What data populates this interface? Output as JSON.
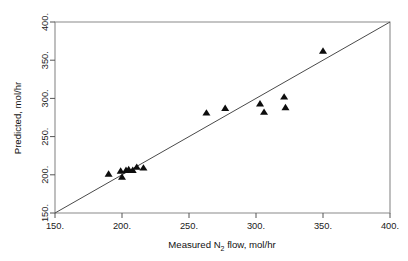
{
  "chart_data": {
    "type": "scatter",
    "title": "",
    "xlabel": "Measured N2 flow, mol/hr",
    "xlabel_parts": {
      "pre": "Measured N",
      "sub": "2",
      "post": " flow, mol/hr"
    },
    "ylabel": "Predicted, mol/hr",
    "xlim": [
      150,
      400
    ],
    "ylim": [
      150,
      400
    ],
    "xticks": [
      150,
      200,
      250,
      300,
      350,
      400
    ],
    "yticks": [
      150,
      200,
      250,
      300,
      350,
      400
    ],
    "xtick_labels": [
      "150.",
      "200.",
      "250.",
      "300.",
      "350.",
      "400."
    ],
    "ytick_labels": [
      "150.",
      "200.",
      "250.",
      "300.",
      "350.",
      "400."
    ],
    "grid": false,
    "legend": false,
    "marker": "triangle-up",
    "marker_color": "#0d0d0d",
    "line_color": "#4a4a4a",
    "frame_color": "#8a8a8a",
    "reference_line": {
      "name": "parity-line",
      "from": [
        150,
        150
      ],
      "to": [
        400,
        400
      ],
      "slope": 1,
      "intercept": 0
    },
    "series": [
      {
        "name": "Predicted vs Measured",
        "points": [
          {
            "x": 190,
            "y": 201
          },
          {
            "x": 199,
            "y": 205
          },
          {
            "x": 200,
            "y": 197
          },
          {
            "x": 203,
            "y": 206
          },
          {
            "x": 205,
            "y": 207
          },
          {
            "x": 208,
            "y": 206
          },
          {
            "x": 211,
            "y": 210
          },
          {
            "x": 216,
            "y": 209
          },
          {
            "x": 263,
            "y": 281
          },
          {
            "x": 277,
            "y": 287
          },
          {
            "x": 303,
            "y": 293
          },
          {
            "x": 306,
            "y": 282
          },
          {
            "x": 321,
            "y": 302
          },
          {
            "x": 322,
            "y": 288
          },
          {
            "x": 350,
            "y": 362
          }
        ]
      }
    ]
  }
}
